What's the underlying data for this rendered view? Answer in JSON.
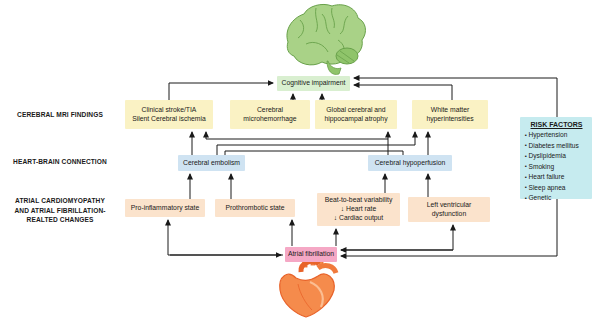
{
  "diagram": {
    "row_labels": {
      "mri": "CEREBRAL MRI FINDINGS",
      "heart_brain": "HEART-BRAIN CONNECTION",
      "atrial": [
        "ATRIAL CARDIOMYOPATHY",
        "AND ATRIAL FIBRILLATION-",
        "REALTED CHANGES"
      ]
    },
    "nodes": {
      "cognitive_impairment": "Cognitive impairment",
      "clinical_stroke": [
        "Clinical stroke/TIA",
        "Silent Cerebral ischemia"
      ],
      "microhemorrhage": [
        "Cerebral",
        "microhemorrhage"
      ],
      "atrophy": [
        "Global cerebral and",
        "hippocampal atrophy"
      ],
      "white_matter": [
        "White matter",
        "hyperintensities"
      ],
      "embolism": "Cerebral embolism",
      "hypoperfusion": "Cerebral hypoperfusion",
      "proinflammatory": "Pro-inflammatory state",
      "prothrombotic": "Prothrombotic state",
      "beat_to_beat": [
        "Beat-to-beat variability",
        "↓ Heart rate",
        "↓ Cardiac output"
      ],
      "lv_dysfunction": [
        "Left ventricular",
        "dysfunction"
      ],
      "atrial_fibrillation": "Atrial fibrillation"
    },
    "risk_factors": {
      "title": "RISK FACTORS",
      "items": [
        "Hypertension",
        "Diabetes mellitus",
        "Dyslipidemia",
        "Smoking",
        "Heart failure",
        "Sleep apnea",
        "Genetic"
      ]
    },
    "colors": {
      "mri_findings_box": "#FAF2C4",
      "connection_box": "#CFE3F2",
      "cardiomyopathy_box": "#FBE3CC",
      "atrial_fibrillation_box": "#F5A8C5",
      "cognitive_impairment_box": "#D9EFD0",
      "risk_factors_box": "#C6EBEF",
      "arrow": "#1A1A1A",
      "brain_green": "#A9D287",
      "heart_orange": "#F58B4C"
    }
  }
}
